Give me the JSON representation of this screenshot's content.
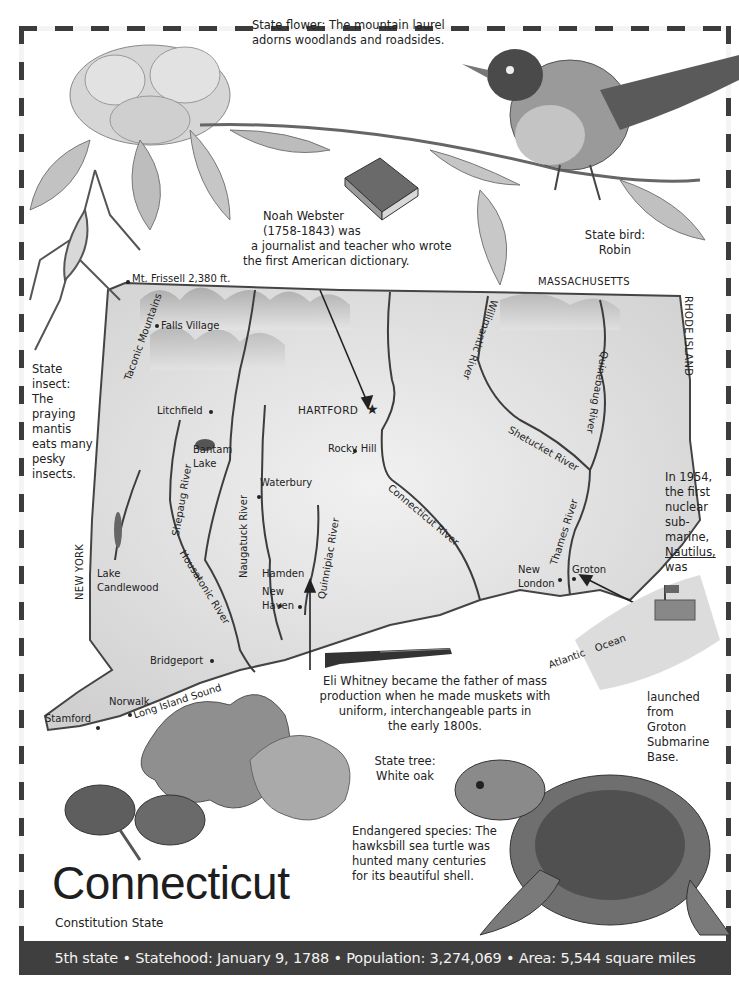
{
  "title": "Connecticut",
  "nickname": "Constitution State",
  "banner": {
    "items": [
      "5th state",
      "Statehood: January 9, 1788",
      "Population: 3,274,069",
      "Area: 5,544 square miles"
    ],
    "separator": "•"
  },
  "captions": {
    "state_flower": "State flower: The mountain laurel adorns woodlands and roadsides.",
    "state_bird_label": "State bird:",
    "state_bird": "Robin",
    "noah_webster": [
      "Noah Webster",
      "(1758-1843) was",
      "a journalist and teacher who wrote",
      "the first American dictionary."
    ],
    "state_insect": [
      "State",
      "insect:",
      "The",
      "praying",
      "mantis",
      "eats many",
      "pesky",
      "insects."
    ],
    "nautilus_top": [
      "In 1954,",
      "the first",
      "nuclear",
      "sub-",
      "marine,",
      "Nautilus,",
      "was"
    ],
    "nautilus_bottom": [
      "launched",
      "from",
      "Groton",
      "Submarine",
      "Base."
    ],
    "eli_whitney": [
      "Eli Whitney became the father of mass",
      "production when he made muskets with",
      "uniform, interchangeable parts in",
      "the early 1800s."
    ],
    "state_tree_label": "State tree:",
    "state_tree": "White oak",
    "endangered": [
      "Endangered species: The",
      "hawksbill sea turtle was",
      "hunted many centuries",
      "for its beautiful shell."
    ],
    "dictionary_book": "Dictionary"
  },
  "map": {
    "neighbors": {
      "north": "MASSACHUSETTS",
      "east": "RHODE ISLAND",
      "west": "NEW YORK"
    },
    "capital": "HARTFORD",
    "peak": "Mt. Frissell 2,380 ft.",
    "mountains": "Taconic Mountains",
    "cities": [
      "Falls Village",
      "Litchfield",
      "Rocky Hill",
      "Waterbury",
      "Hamden",
      "New Haven",
      "Bridgeport",
      "Norwalk",
      "Stamford",
      "New London",
      "Groton"
    ],
    "lakes": [
      "Bantam Lake",
      "Lake Candlewood"
    ],
    "rivers": [
      "Connecticut River",
      "Housatonic River",
      "Naugatuck River",
      "Shepaug River",
      "Quinnipiac River",
      "Willimantic River",
      "Shetucket River",
      "Quinebaug River",
      "Thames River"
    ],
    "waters": [
      "Long Island Sound",
      "Atlantic Ocean"
    ]
  }
}
